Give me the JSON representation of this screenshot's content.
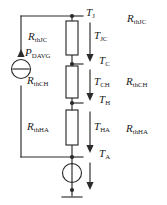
{
  "diagram": {
    "line_color": "#2b2b2b",
    "text_color": "#1a1a1a",
    "background": "#ffffff",
    "resistors": [
      {
        "name": "rthjc",
        "base": "R",
        "sub": "thJC"
      },
      {
        "name": "rthch",
        "base": "R",
        "sub": "thCH"
      },
      {
        "name": "rthha",
        "base": "R",
        "sub": "thHA"
      }
    ],
    "right_labels": [
      {
        "name": "rthjc-right",
        "base": "R",
        "sub": "thJC"
      },
      {
        "name": "rthch-right",
        "base": "R",
        "sub": "thCH"
      },
      {
        "name": "rthha-right",
        "base": "R",
        "sub": "thHA"
      }
    ],
    "nodes": [
      {
        "name": "node-tj",
        "base": "T",
        "sub": "J"
      },
      {
        "name": "node-tc",
        "base": "T",
        "sub": "C"
      },
      {
        "name": "node-th",
        "base": "T",
        "sub": "H"
      },
      {
        "name": "node-ta",
        "base": "T",
        "sub": "A"
      }
    ],
    "drops": [
      {
        "name": "drop-tjc",
        "base": "T",
        "sub": "JC"
      },
      {
        "name": "drop-tch",
        "base": "T",
        "sub": "CH"
      },
      {
        "name": "drop-tha",
        "base": "T",
        "sub": "HA"
      }
    ],
    "source": {
      "name": "power-source",
      "base": "P",
      "sub": "DAVG"
    }
  }
}
